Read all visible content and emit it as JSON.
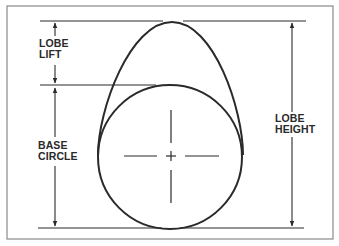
{
  "diagram": {
    "colors": {
      "stroke": "#2a2a2a",
      "frame": "#8a8a8a",
      "background": "#ffffff"
    },
    "labels": {
      "lobe_lift": {
        "line1": "LOBE",
        "line2": "LIFT"
      },
      "base_circle": {
        "line1": "BASE",
        "line2": "CIRCLE"
      },
      "lobe_height": {
        "line1": "LOBE",
        "line2": "HEIGHT"
      }
    },
    "elements": [
      "outer-frame",
      "cam-lobe-profile",
      "base-circle",
      "center-crosshair",
      "top-reference-line",
      "base-circle-top-line",
      "bottom-reference-line",
      "lobe-lift-dimension-arrow",
      "base-circle-dimension-arrow",
      "lobe-height-dimension-arrow"
    ]
  }
}
